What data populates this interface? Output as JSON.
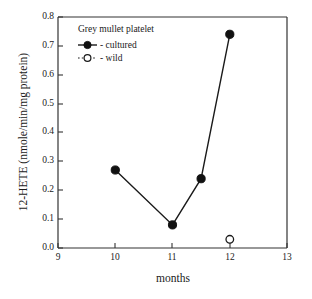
{
  "chart_data": {
    "type": "line",
    "title": "",
    "xlabel": "months",
    "ylabel": "12-HETE (nmole/min/mg protein)",
    "xlim": [
      9,
      13
    ],
    "ylim": [
      0.0,
      0.8
    ],
    "xticks": [
      "9",
      "10",
      "11",
      "12",
      "13"
    ],
    "yticks": [
      "0.0",
      "0.1",
      "0.2",
      "0.3",
      "0.4",
      "0.5",
      "0.6",
      "0.7",
      "0.8"
    ],
    "grid": false,
    "legend_position": "upper-left-inside",
    "legend_title": "Grey mullet platelet",
    "series": [
      {
        "name": "- cultured",
        "marker": "filled-circle",
        "line": "solid",
        "x": [
          10,
          11,
          11.5,
          12
        ],
        "values": [
          0.27,
          0.08,
          0.24,
          0.74
        ]
      },
      {
        "name": "- wild",
        "marker": "open-circle",
        "line": "dotted",
        "x": [
          12
        ],
        "values": [
          0.03
        ]
      }
    ]
  },
  "axes": {
    "y_title": "12-HETE (nmole/min/mg protein)",
    "x_title": "months",
    "y_tick_labels": [
      "0.8",
      "0.7",
      "0.6",
      "0.5",
      "0.4",
      "0.3",
      "0.2",
      "0.1",
      "0.0"
    ],
    "x_tick_labels": [
      "9",
      "10",
      "11",
      "12",
      "13"
    ]
  },
  "legend": {
    "title": "Grey mullet platelet",
    "entries": [
      {
        "label": "- cultured"
      },
      {
        "label": "- wild"
      }
    ]
  },
  "colors": {
    "foreground": "#1a1a1a",
    "background": "#ffffff",
    "marker": "#111111"
  }
}
